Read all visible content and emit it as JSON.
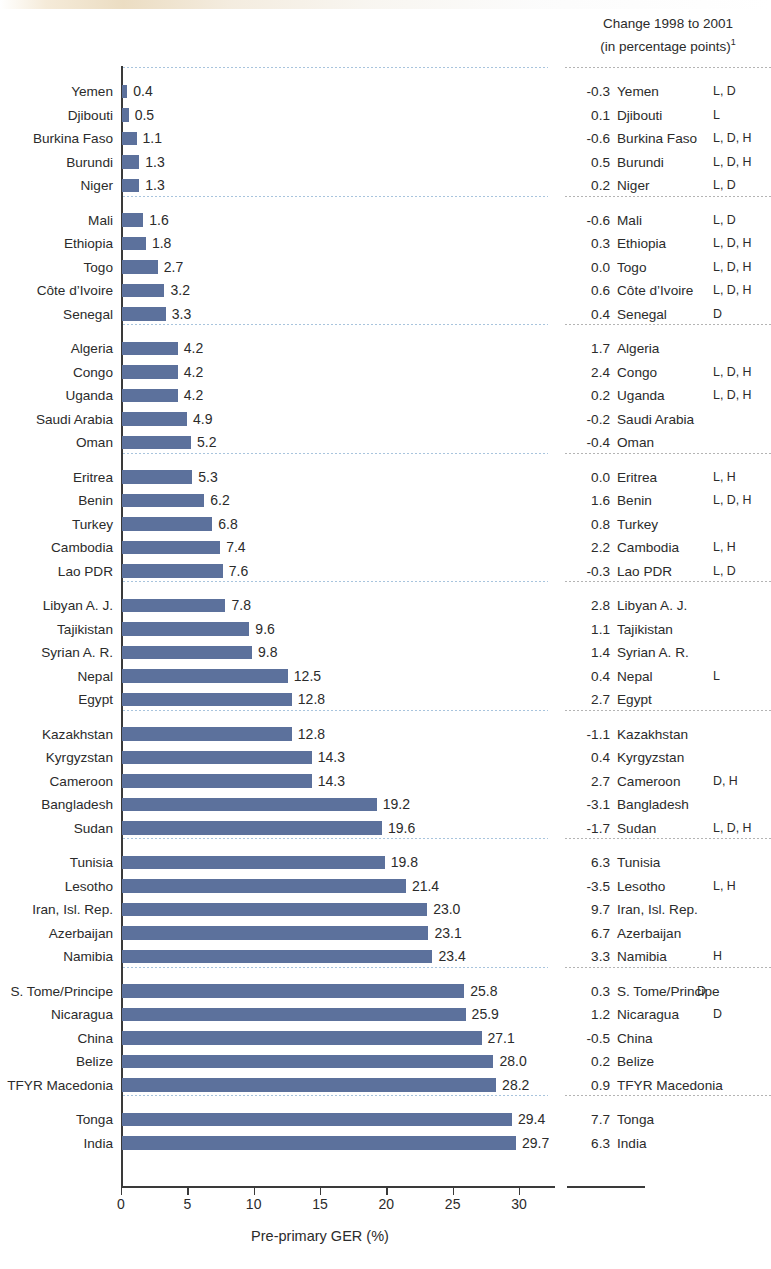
{
  "header": {
    "line1": "Change 1998 to 2001",
    "line2": "(in percentage points)",
    "footnote_marker": "1"
  },
  "axis": {
    "xlabel": "Pre-primary GER (%)",
    "ticks": [
      "0",
      "5",
      "10",
      "15",
      "20",
      "25",
      "30"
    ]
  },
  "chart_data": {
    "type": "bar",
    "orientation": "horizontal",
    "title": "",
    "xlabel": "Pre-primary GER (%)",
    "ylabel": "",
    "xlim": [
      0,
      30
    ],
    "xticks": [
      0,
      5,
      10,
      15,
      20,
      25,
      30
    ],
    "grid": false,
    "legend": null,
    "bar_color": "#5c719c",
    "second_column_header": "Change 1998 to 2001 (in percentage points)1",
    "group_separators_after": [
      5,
      10,
      15,
      20,
      25,
      30,
      35,
      40,
      45
    ],
    "categories": [
      "Yemen",
      "Djibouti",
      "Burkina Faso",
      "Burundi",
      "Niger",
      "Mali",
      "Ethiopia",
      "Togo",
      "Côte d’Ivoire",
      "Senegal",
      "Algeria",
      "Congo",
      "Uganda",
      "Saudi Arabia",
      "Oman",
      "Eritrea",
      "Benin",
      "Turkey",
      "Cambodia",
      "Lao PDR",
      "Libyan A. J.",
      "Tajikistan",
      "Syrian A. R.",
      "Nepal",
      "Egypt",
      "Kazakhstan",
      "Kyrgyzstan",
      "Cameroon",
      "Bangladesh",
      "Sudan",
      "Tunisia",
      "Lesotho",
      "Iran, Isl. Rep.",
      "Azerbaijan",
      "Namibia",
      "S. Tome/Principe",
      "Nicaragua",
      "China",
      "Belize",
      "TFYR Macedonia",
      "Tonga",
      "India"
    ],
    "values": [
      0.4,
      0.5,
      1.1,
      1.3,
      1.3,
      1.6,
      1.8,
      2.7,
      3.2,
      3.3,
      4.2,
      4.2,
      4.2,
      4.9,
      5.2,
      5.3,
      6.2,
      6.8,
      7.4,
      7.6,
      7.8,
      9.6,
      9.8,
      12.5,
      12.8,
      12.8,
      14.3,
      14.3,
      19.2,
      19.6,
      19.8,
      21.4,
      23.0,
      23.1,
      23.4,
      25.8,
      25.9,
      27.1,
      28.0,
      28.2,
      29.4,
      29.7
    ],
    "value_labels": [
      "0.4",
      "0.5",
      "1.1",
      "1.3",
      "1.3",
      "1.6",
      "1.8",
      "2.7",
      "3.2",
      "3.3",
      "4.2",
      "4.2",
      "4.2",
      "4.9",
      "5.2",
      "5.3",
      "6.2",
      "6.8",
      "7.4",
      "7.6",
      "7.8",
      "9.6",
      "9.8",
      "12.5",
      "12.8",
      "12.8",
      "14.3",
      "14.3",
      "19.2",
      "19.6",
      "19.8",
      "21.4",
      "23.0",
      "23.1",
      "23.4",
      "25.8",
      "25.9",
      "27.1",
      "28.0",
      "28.2",
      "29.4",
      "29.7"
    ],
    "change_values": [
      -0.3,
      0.1,
      -0.6,
      0.5,
      0.2,
      -0.6,
      0.3,
      0.0,
      0.6,
      0.4,
      1.7,
      2.4,
      0.2,
      -0.2,
      -0.4,
      0.0,
      1.6,
      0.8,
      2.2,
      -0.3,
      2.8,
      1.1,
      1.4,
      0.4,
      2.7,
      -1.1,
      0.4,
      2.7,
      -3.1,
      -1.7,
      6.3,
      -3.5,
      9.7,
      6.7,
      3.3,
      0.3,
      1.2,
      -0.5,
      0.2,
      0.9,
      7.7,
      6.3
    ],
    "change_labels": [
      "-0.3",
      "0.1",
      "-0.6",
      "0.5",
      "0.2",
      "-0.6",
      "0.3",
      "0.0",
      "0.6",
      "0.4",
      "1.7",
      "2.4",
      "0.2",
      "-0.2",
      "-0.4",
      "0.0",
      "1.6",
      "0.8",
      "2.2",
      "-0.3",
      "2.8",
      "1.1",
      "1.4",
      "0.4",
      "2.7",
      "-1.1",
      "0.4",
      "2.7",
      "-3.1",
      "-1.7",
      "6.3",
      "-3.5",
      "9.7",
      "6.7",
      "3.3",
      "0.3",
      "1.2",
      "-0.5",
      "0.2",
      "0.9",
      "7.7",
      "6.3"
    ],
    "flags": [
      "L, D",
      "L",
      "L, D, H",
      "L, D, H",
      "L, D",
      "L, D",
      "L, D, H",
      "L, D, H",
      "L, D, H",
      "D",
      "",
      "L, D, H",
      "L, D, H",
      "",
      "",
      "L, H",
      "L, D, H",
      "",
      "L, H",
      "L, D",
      "",
      "",
      "",
      "L",
      "",
      "",
      "",
      "D, H",
      "",
      "L, D, H",
      "",
      "L, H",
      "",
      "",
      "H",
      "D",
      "D",
      "",
      "",
      "",
      "",
      ""
    ]
  }
}
